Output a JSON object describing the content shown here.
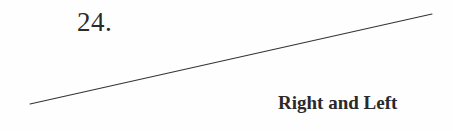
{
  "chapter": {
    "number": "24.",
    "title": "Right and Left"
  },
  "colors": {
    "text": "#2a2a2a",
    "rule": "#333333",
    "background": "#fefefe"
  }
}
